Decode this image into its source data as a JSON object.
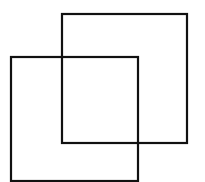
{
  "diagram": {
    "width": 205,
    "height": 182,
    "background": "#ffffff",
    "stroke_color": "#111111",
    "stroke_width": 2.2,
    "shapes": [
      {
        "name": "back-square",
        "x": 62,
        "y": 14,
        "w": 125,
        "h": 129
      },
      {
        "name": "front-square",
        "x": 11,
        "y": 57,
        "w": 127,
        "h": 124
      }
    ]
  }
}
